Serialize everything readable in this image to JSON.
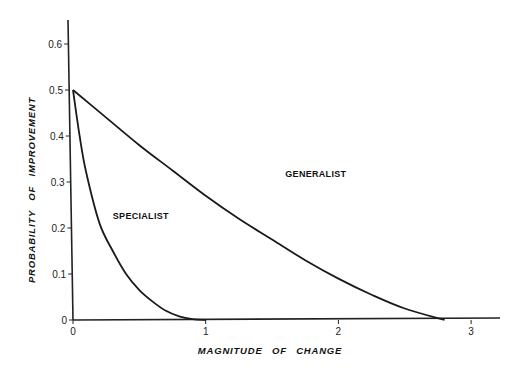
{
  "chart_data": {
    "type": "line",
    "title": "",
    "xlabel": "MAGNITUDE OF CHANGE",
    "ylabel": "PROBABILITY OF IMPROVEMENT",
    "xlim": [
      0,
      3.2
    ],
    "ylim": [
      0,
      0.65
    ],
    "x_ticks": [
      "0",
      "1",
      "2",
      "3"
    ],
    "y_ticks": [
      "0",
      "0.1",
      "0.2",
      "0.3",
      "0.4",
      "0.5",
      "0.6"
    ],
    "grid": false,
    "legend": "inline labels",
    "series": [
      {
        "name": "SPECIALIST",
        "x": [
          0,
          0.05,
          0.1,
          0.2,
          0.3,
          0.4,
          0.5,
          0.6,
          0.7,
          0.8,
          0.9,
          1.0
        ],
        "y": [
          0.5,
          0.4,
          0.32,
          0.21,
          0.15,
          0.1,
          0.065,
          0.04,
          0.02,
          0.008,
          0.002,
          0
        ]
      },
      {
        "name": "GENERALIST",
        "x": [
          0,
          0.25,
          0.5,
          0.75,
          1.0,
          1.25,
          1.5,
          1.75,
          2.0,
          2.25,
          2.5,
          2.8
        ],
        "y": [
          0.5,
          0.44,
          0.38,
          0.325,
          0.27,
          0.22,
          0.175,
          0.13,
          0.09,
          0.055,
          0.025,
          0
        ]
      }
    ],
    "annotations": [
      {
        "text": "GENERALIST",
        "x": 1.6,
        "y": 0.31
      },
      {
        "text": "SPECIALIST",
        "x": 0.3,
        "y": 0.22
      }
    ]
  }
}
